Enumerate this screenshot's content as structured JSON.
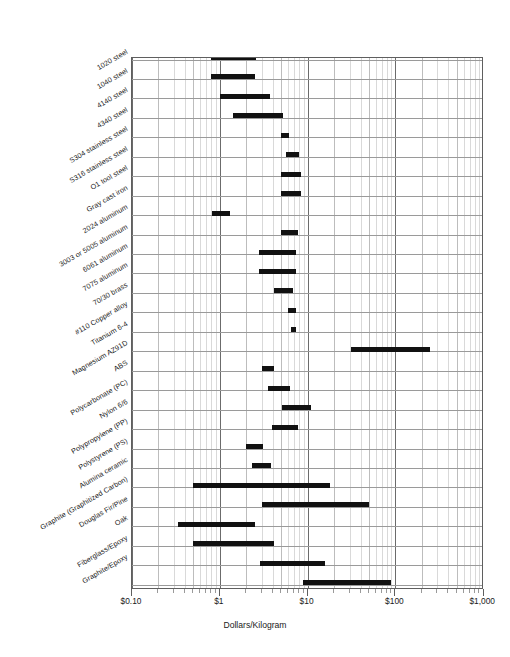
{
  "chart_data": {
    "type": "bar",
    "subtype": "range-bar-horizontal-log",
    "title": "",
    "subtitle": "",
    "xlabel": "Dollars/Kilogram",
    "ylabel": "",
    "xscale": "log",
    "xlim": [
      0.1,
      1000
    ],
    "xticks": [
      0.1,
      1,
      10,
      100,
      1000
    ],
    "xticklabels": [
      "$0.10",
      "$1",
      "$10",
      "$100",
      "$1,000"
    ],
    "grid": true,
    "legend": null,
    "categories": [
      "1020 steel",
      "1040 steel",
      "4140 steel",
      "4340 steel",
      "S304 stainless steel",
      "S316 stainless steel",
      "O1 tool steel",
      "Gray cast iron",
      "2024 aluminum",
      "3003 or 5005 aluminum",
      "6061 aluminum",
      "7075 aluminum",
      "70/30 brass",
      "#110 Copper alloy",
      "Titanium 6-4",
      "Magnesium AZ91D",
      "ABS",
      "Polycarbonate (PC)",
      "Nylon 6/6",
      "Polypropylene (PP)",
      "Polystyrene (PS)",
      "Alumina ceramic",
      "Graphite (Graphitized Carbon)",
      "Douglas Fir/Pine",
      "Oak",
      "Fiberglass/Epoxy",
      "Graphite/Epoxy"
    ],
    "ranges": [
      {
        "label": "1020 steel",
        "low": 0.8,
        "high": 2.6
      },
      {
        "label": "1040 steel",
        "low": 0.8,
        "high": 2.5
      },
      {
        "label": "4140 steel",
        "low": 1.0,
        "high": 3.7
      },
      {
        "label": "4340 steel",
        "low": 1.4,
        "high": 5.2
      },
      {
        "label": "S304 stainless steel",
        "low": 5.0,
        "high": 6.1
      },
      {
        "label": "S316 stainless steel",
        "low": 5.7,
        "high": 8.0
      },
      {
        "label": "O1 tool steel",
        "low": 5.0,
        "high": 8.4
      },
      {
        "label": "Gray cast iron",
        "low": 5.0,
        "high": 8.4
      },
      {
        "label": "2024 aluminum",
        "low": 0.82,
        "high": 1.3
      },
      {
        "label": "3003 or 5005 aluminum",
        "low": 5.0,
        "high": 7.7
      },
      {
        "label": "6061 aluminum",
        "low": 2.8,
        "high": 7.3
      },
      {
        "label": "7075 aluminum",
        "low": 2.8,
        "high": 7.3
      },
      {
        "label": "70/30 brass",
        "low": 4.1,
        "high": 6.9
      },
      {
        "label": "#110 Copper alloy",
        "low": 5.9,
        "high": 7.3
      },
      {
        "label": "Titanium 6-4",
        "low": 6.5,
        "high": 7.3
      },
      {
        "label": "Magnesium AZ91D",
        "low": 31.0,
        "high": 250.0
      },
      {
        "label": "ABS",
        "low": 3.0,
        "high": 4.1
      },
      {
        "label": "Polycarbonate (PC)",
        "low": 3.5,
        "high": 6.3
      },
      {
        "label": "Nylon 6/6",
        "low": 5.1,
        "high": 11.0
      },
      {
        "label": "Polypropylene (PP)",
        "low": 3.9,
        "high": 7.7
      },
      {
        "label": "Polystyrene (PS)",
        "low": 2.0,
        "high": 3.1
      },
      {
        "label": "Alumina ceramic",
        "low": 2.3,
        "high": 3.8
      },
      {
        "label": "Graphite (Graphitized Carbon)",
        "low": 0.5,
        "high": 18.0
      },
      {
        "label": "Douglas Fir/Pine",
        "low": 3.0,
        "high": 50.0
      },
      {
        "label": "Oak",
        "low": 0.33,
        "high": 2.5
      },
      {
        "label": "Fiberglass/Epoxy",
        "low": 0.49,
        "high": 4.2
      },
      {
        "label": "Graphite/Epoxy",
        "low": 2.9,
        "high": 16.0
      },
      {
        "label": "Graphite/Epoxy (high grade)",
        "low": 8.8,
        "high": 90.0
      }
    ],
    "bar_color": "#111111",
    "grid_color": "#d9d9d9",
    "axis_color": "#5f5f5f"
  },
  "axis": {
    "x_title": "Dollars/Kilogram",
    "tick_0": "$0.10",
    "tick_1": "$1",
    "tick_2": "$10",
    "tick_3": "$100",
    "tick_4": "$1,000"
  },
  "labels": {
    "l0": "1020 steel",
    "l1": "1040 steel",
    "l2": "4140 steel",
    "l3": "4340 steel",
    "l4": "S304 stainless steel",
    "l5": "S316 stainless steel",
    "l6": "O1 tool steel",
    "l7": "Gray cast iron",
    "l8": "2024 aluminum",
    "l9": "3003 or 5005 aluminum",
    "l10": "6061 aluminum",
    "l11": "7075 aluminum",
    "l12": "70/30 brass",
    "l13": "#110 Copper alloy",
    "l14": "Titanium 6-4",
    "l15": "Magnesium AZ91D",
    "l16": "ABS",
    "l17": "Polycarbonate (PC)",
    "l18": "Nylon 6/6",
    "l19": "Polypropylene (PP)",
    "l20": "Polystyrene (PS)",
    "l21": "Alumina ceramic",
    "l22": "Graphite (Graphitized Carbon)",
    "l23": "Douglas Fir/Pine",
    "l24": "Oak",
    "l25": "Fiberglass/Epoxy",
    "l26": "Graphite/Epoxy"
  }
}
